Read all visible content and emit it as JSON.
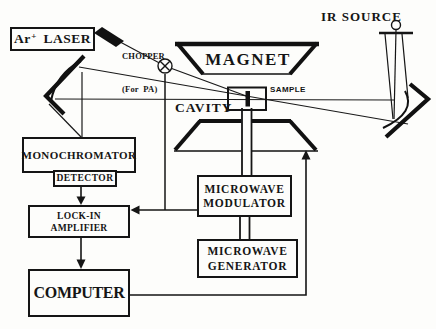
{
  "colors": {
    "ink": "#151515",
    "paper": "#fdfdfb"
  },
  "nodes": {
    "laser": {
      "element": "Ar",
      "charge": "+",
      "label": "LASER"
    },
    "chopper": {
      "label": "CHOPPER",
      "note": "(For  PA)"
    },
    "magnet": {
      "label": "MAGNET"
    },
    "ir_source": {
      "label": "IR SOURCE"
    },
    "sample": {
      "label": "SAMPLE"
    },
    "cavity": {
      "label": "CAVITY"
    },
    "monochromator": {
      "label": "MONOCHROMATOR"
    },
    "detector": {
      "label": "DETECTOR"
    },
    "lock_in": {
      "line1": "LOCK-IN",
      "line2": "AMPLIFIER"
    },
    "computer": {
      "label": "COMPUTER"
    },
    "mw_modulator": {
      "line1": "MICROWAVE",
      "line2": "MODULATOR"
    },
    "mw_generator": {
      "line1": "MICROWAVE",
      "line2": "GENERATOR"
    }
  },
  "connections": [
    "laser -> chopper -> sample (optical beam)",
    "ir_source -> right concave mirror -> sample -> left concave mirror -> monochromator (IR beam)",
    "detector -> lock_in (arrow)",
    "chopper -> lock_in (reference wire)",
    "mw_modulator -> lock_in (arrow)",
    "lock_in -> computer (arrow)",
    "computer -> magnet (arrow, field sweep)",
    "mw_generator -> mw_modulator (waveguide)",
    "mw_modulator -> cavity (waveguide)"
  ]
}
